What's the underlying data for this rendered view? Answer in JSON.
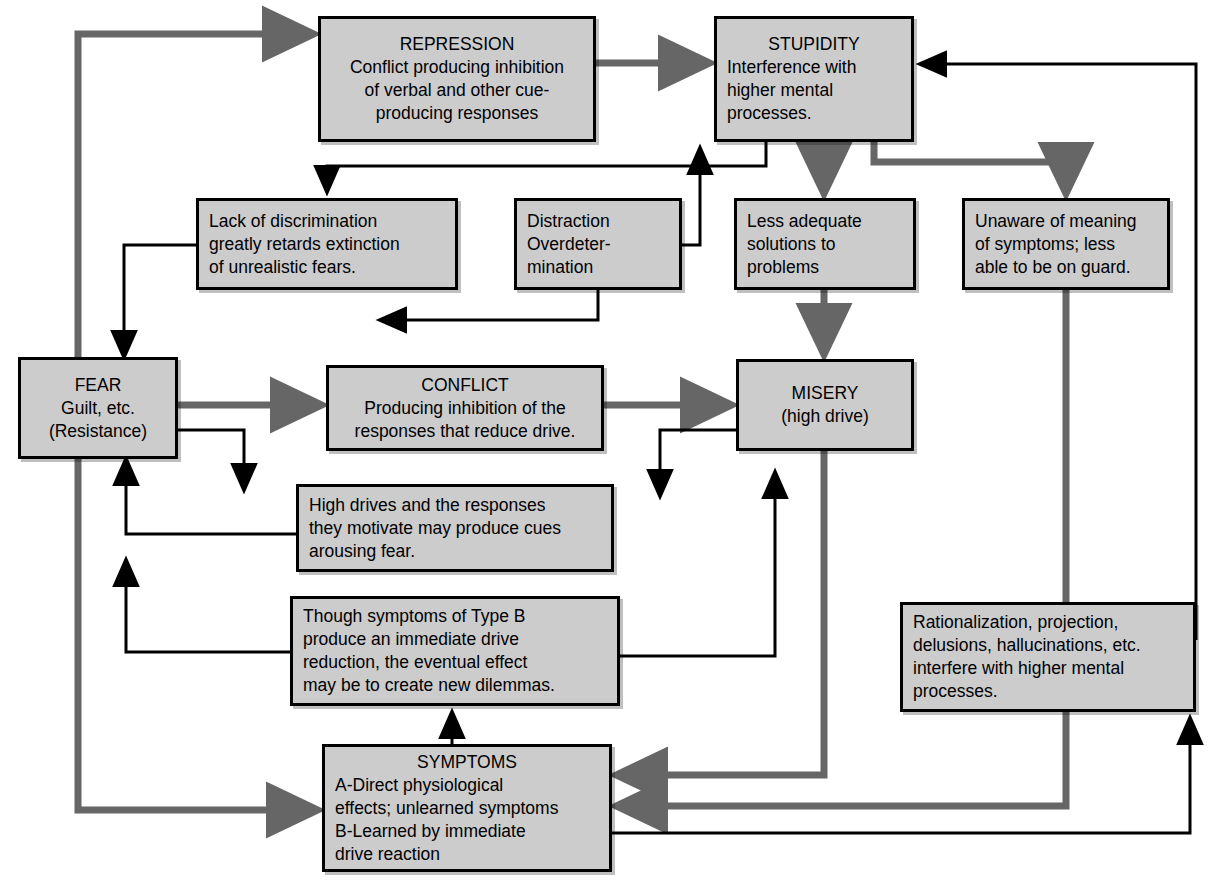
{
  "diagram": {
    "style": {
      "box_fill": "#cccccc",
      "box_border": "#000000",
      "thick_arrow_color": "#666666",
      "thin_arrow_color": "#000000",
      "background": "#ffffff"
    },
    "nodes": [
      {
        "id": "repression",
        "title": "REPRESSION",
        "lines": [
          "Conflict producing inhibition",
          "of verbal and other cue-",
          "producing responses"
        ],
        "x": 318,
        "y": 16,
        "w": 278,
        "h": 126
      },
      {
        "id": "stupidity",
        "title": "STUPIDITY",
        "lines": [
          "Interference with",
          "higher mental",
          "processes."
        ],
        "x": 714,
        "y": 16,
        "w": 200,
        "h": 126
      },
      {
        "id": "lack-of-discrimination",
        "title": "",
        "lines": [
          "Lack of discrimination",
          "greatly retards extinction",
          "of unrealistic fears."
        ],
        "x": 196,
        "y": 198,
        "w": 262,
        "h": 92
      },
      {
        "id": "distraction",
        "title": "",
        "lines": [
          "Distraction",
          "Overdeter-",
          "mination"
        ],
        "x": 514,
        "y": 198,
        "w": 168,
        "h": 92
      },
      {
        "id": "less-adequate-solutions",
        "title": "",
        "lines": [
          "Less adequate",
          "solutions to",
          "problems"
        ],
        "x": 734,
        "y": 198,
        "w": 182,
        "h": 92
      },
      {
        "id": "unaware-of-meaning",
        "title": "",
        "lines": [
          "Unaware of meaning",
          "of symptoms; less",
          "able to be on guard."
        ],
        "x": 962,
        "y": 198,
        "w": 208,
        "h": 92
      },
      {
        "id": "fear",
        "title": "FEAR",
        "lines": [
          "Guilt, etc.",
          "(Resistance)"
        ],
        "x": 18,
        "y": 357,
        "w": 160,
        "h": 102
      },
      {
        "id": "conflict",
        "title": "CONFLICT",
        "lines": [
          "Producing inhibition of the",
          "responses that reduce drive."
        ],
        "x": 326,
        "y": 365,
        "w": 278,
        "h": 86
      },
      {
        "id": "misery",
        "title": "MISERY",
        "lines": [
          "(high drive)"
        ],
        "x": 736,
        "y": 359,
        "w": 178,
        "h": 92
      },
      {
        "id": "high-drives",
        "title": "",
        "lines": [
          "High drives and the responses",
          "they motivate may produce cues",
          "arousing fear."
        ],
        "x": 296,
        "y": 484,
        "w": 318,
        "h": 88
      },
      {
        "id": "type-b-symptoms",
        "title": "",
        "lines": [
          "Though symptoms of Type B",
          "produce an immediate drive",
          "reduction, the eventual effect",
          "may be to create new dilemmas."
        ],
        "x": 290,
        "y": 596,
        "w": 330,
        "h": 110
      },
      {
        "id": "rationalization",
        "title": "",
        "lines": [
          "Rationalization, projection,",
          "delusions, hallucinations, etc.",
          "interfere with higher mental",
          "processes."
        ],
        "x": 900,
        "y": 602,
        "w": 296,
        "h": 110
      },
      {
        "id": "symptoms",
        "title": "SYMPTOMS",
        "lines": [
          "A-Direct physiological",
          "effects; unlearned symptoms",
          "B-Learned by immediate",
          "drive reaction"
        ],
        "x": 322,
        "y": 744,
        "w": 290,
        "h": 128
      }
    ],
    "edges": [
      {
        "from": "fear",
        "to": "repression",
        "type": "thick"
      },
      {
        "from": "repression",
        "to": "stupidity",
        "type": "thick"
      },
      {
        "from": "fear",
        "to": "conflict",
        "type": "thick"
      },
      {
        "from": "conflict",
        "to": "misery",
        "type": "thick"
      },
      {
        "from": "stupidity",
        "to": "less-adequate-solutions",
        "type": "thick"
      },
      {
        "from": "less-adequate-solutions",
        "to": "misery",
        "type": "thick"
      },
      {
        "from": "stupidity",
        "to": "unaware-of-meaning",
        "type": "thick"
      },
      {
        "from": "unaware-of-meaning",
        "to": "symptoms",
        "type": "thick"
      },
      {
        "from": "misery",
        "to": "symptoms",
        "type": "thick"
      },
      {
        "from": "fear",
        "to": "symptoms",
        "type": "thick"
      },
      {
        "from": "stupidity",
        "to": "lack-of-discrimination",
        "type": "thin"
      },
      {
        "from": "lack-of-discrimination",
        "to": "fear",
        "type": "thin"
      },
      {
        "from": "distraction",
        "to": "stupidity",
        "type": "thin"
      },
      {
        "from": "distraction",
        "to": "conflict",
        "type": "thin"
      },
      {
        "from": "fear",
        "to": "high-drives",
        "type": "thin"
      },
      {
        "from": "high-drives",
        "to": "fear",
        "type": "thin"
      },
      {
        "from": "misery",
        "to": "high-drives",
        "type": "thin"
      },
      {
        "from": "type-b-symptoms",
        "to": "fear",
        "type": "thin"
      },
      {
        "from": "type-b-symptoms",
        "to": "misery",
        "type": "thin"
      },
      {
        "from": "symptoms",
        "to": "type-b-symptoms",
        "type": "thin"
      },
      {
        "from": "symptoms",
        "to": "rationalization",
        "type": "thin"
      },
      {
        "from": "rationalization",
        "to": "stupidity",
        "type": "thin"
      }
    ]
  }
}
